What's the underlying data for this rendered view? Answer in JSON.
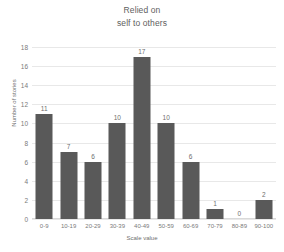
{
  "chart_data": {
    "type": "bar",
    "title": "Relied on",
    "subtitle": "self to others",
    "xlabel": "Scale value",
    "ylabel": "Number of stories",
    "categories": [
      "0-9",
      "10-19",
      "20-29",
      "30-39",
      "40-49",
      "50-59",
      "60-69",
      "70-79",
      "80-89",
      "90-100"
    ],
    "values": [
      11,
      7,
      6,
      10,
      17,
      10,
      6,
      1,
      0,
      2
    ],
    "value_labels": [
      "11",
      "7",
      "6",
      "10",
      "17",
      "10",
      "6",
      "1",
      "0",
      "2"
    ],
    "ylim": [
      0,
      18
    ],
    "ytick_values": [
      0,
      2,
      4,
      6,
      8,
      10,
      12,
      14,
      16,
      18
    ],
    "ytick_labels": [
      "0",
      "2",
      "4",
      "6",
      "8",
      "10",
      "12",
      "14",
      "16",
      "18"
    ],
    "grid": "horizontal",
    "legend": "none",
    "bar_color": "#595959",
    "grid_color": "#e8e8e8",
    "text_color": "#6e6e6e",
    "background": "#ffffff"
  }
}
